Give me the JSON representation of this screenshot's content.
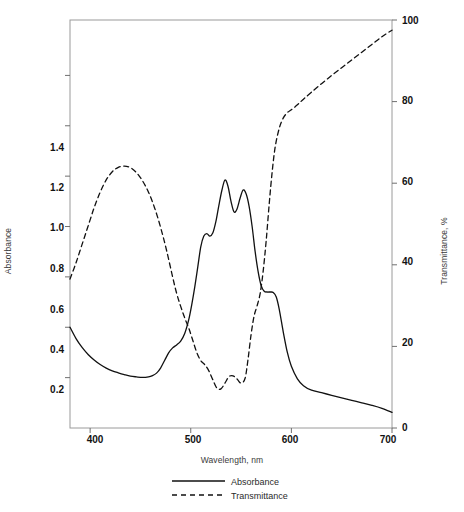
{
  "chart_data": {
    "type": "line",
    "title": "",
    "xlabel": "Wavelength, nm",
    "ylabel": "Absorbance",
    "y2label": "Transmittance, %",
    "xlim": [
      380,
      700
    ],
    "ylim": [
      0.0,
      1.62
    ],
    "y2lim": [
      0,
      100
    ],
    "grid": false,
    "legend_position": "bottom-center",
    "xticks": [
      400,
      500,
      600,
      700
    ],
    "xtick_labels": [
      "400",
      "500",
      "600",
      "700"
    ],
    "yticks": [
      0.2,
      0.4,
      0.6,
      0.8,
      1.0,
      1.2,
      1.4
    ],
    "ytick_labels": [
      "0.2",
      "0.4",
      "0.6",
      "0.8",
      "1.0",
      "1.2",
      "1.4"
    ],
    "y2ticks": [
      0,
      20,
      40,
      60,
      80,
      100
    ],
    "y2tick_labels": [
      "0",
      "20",
      "40",
      "60",
      "80",
      "100"
    ],
    "series": [
      {
        "name": "Absorbance",
        "axis": "left",
        "style": "solid",
        "color": "#111111",
        "x": [
          380,
          386,
          392,
          398,
          404,
          410,
          416,
          422,
          428,
          434,
          440,
          446,
          452,
          458,
          462,
          466,
          470,
          474,
          478,
          482,
          486,
          490,
          494,
          498,
          501,
          504,
          507,
          510,
          513,
          516,
          519,
          522,
          525,
          528,
          531,
          534,
          537,
          540,
          543,
          546,
          549,
          552,
          555,
          558,
          561,
          564,
          567,
          570,
          573,
          576,
          579,
          582,
          585,
          588,
          592,
          596,
          600,
          606,
          612,
          620,
          630,
          640,
          650,
          660,
          670,
          680,
          690,
          700
        ],
        "y": [
          0.4,
          0.355,
          0.32,
          0.292,
          0.27,
          0.252,
          0.238,
          0.227,
          0.219,
          0.212,
          0.206,
          0.203,
          0.201,
          0.203,
          0.208,
          0.218,
          0.238,
          0.268,
          0.298,
          0.318,
          0.33,
          0.345,
          0.375,
          0.43,
          0.49,
          0.56,
          0.64,
          0.72,
          0.762,
          0.772,
          0.762,
          0.775,
          0.82,
          0.885,
          0.945,
          0.985,
          0.96,
          0.9,
          0.858,
          0.87,
          0.912,
          0.945,
          0.93,
          0.88,
          0.8,
          0.7,
          0.62,
          0.565,
          0.543,
          0.54,
          0.54,
          0.538,
          0.52,
          0.47,
          0.38,
          0.3,
          0.245,
          0.195,
          0.168,
          0.15,
          0.14,
          0.13,
          0.12,
          0.11,
          0.1,
          0.09,
          0.078,
          0.062
        ]
      },
      {
        "name": "Transmittance",
        "axis": "right",
        "style": "dashed",
        "color": "#111111",
        "x": [
          380,
          386,
          392,
          398,
          404,
          410,
          416,
          422,
          428,
          434,
          440,
          446,
          452,
          458,
          464,
          470,
          476,
          482,
          486,
          490,
          494,
          498,
          502,
          506,
          510,
          514,
          518,
          522,
          526,
          530,
          534,
          538,
          542,
          546,
          550,
          554,
          557,
          560,
          563,
          566,
          569,
          572,
          575,
          578,
          581,
          584,
          588,
          592,
          596,
          600,
          606,
          612,
          620,
          630,
          640,
          650,
          660,
          670,
          680,
          690,
          700
        ],
        "y": [
          36.5,
          40.5,
          45.0,
          49.5,
          54.0,
          57.8,
          60.8,
          62.8,
          63.9,
          64.2,
          63.8,
          62.6,
          60.6,
          57.8,
          54.0,
          49.2,
          43.5,
          37.0,
          33.0,
          29.8,
          27.0,
          24.5,
          21.5,
          18.5,
          16.5,
          15.5,
          14.0,
          11.8,
          9.8,
          9.6,
          11.0,
          12.6,
          12.8,
          12.0,
          11.0,
          12.2,
          17.0,
          23.0,
          27.5,
          30.0,
          33.0,
          38.5,
          46.0,
          55.0,
          63.0,
          69.0,
          73.5,
          76.0,
          77.3,
          78.0,
          79.2,
          80.6,
          82.3,
          84.4,
          86.4,
          88.3,
          90.2,
          92.1,
          94.0,
          95.9,
          97.5
        ]
      }
    ],
    "legend": [
      {
        "label": "Absorbance",
        "style": "solid"
      },
      {
        "label": "Transmittance",
        "style": "dashed"
      }
    ]
  },
  "colors": {
    "frame": "#9a9a9a",
    "tick": "#6f6f6f",
    "curve": "#111111",
    "background": "#ffffff"
  }
}
